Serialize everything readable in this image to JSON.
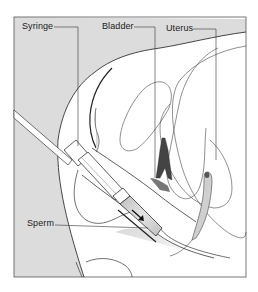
{
  "figure": {
    "type": "medical illustration",
    "labels": {
      "syringe": "Syringe",
      "bladder": "Bladder",
      "uterus": "Uterus",
      "sperm": "Sperm"
    },
    "colors": {
      "background_shade": "#dcdcdc",
      "line": "#333333",
      "frame": "#555555"
    }
  }
}
